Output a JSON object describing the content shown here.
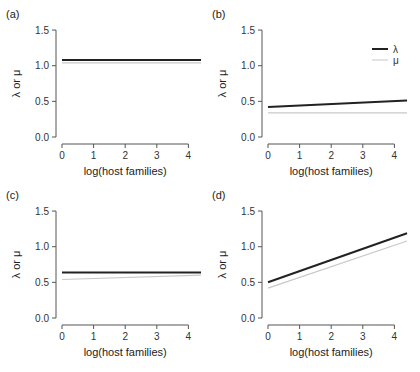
{
  "figure": {
    "width": 420,
    "height": 372,
    "colors": {
      "lambda": "#222222",
      "mu": "#c8c8c8",
      "axis": "#555555"
    }
  },
  "legend": {
    "entries": [
      {
        "label": "λ",
        "color": "#222222",
        "width": 2
      },
      {
        "label": "μ",
        "color": "#c8c8c8",
        "width": 1
      }
    ]
  },
  "chart_data": [
    {
      "type": "line",
      "panel": "(a)",
      "xlabel": "log(host families)",
      "ylabel": "λ or μ",
      "xticks": [
        "0",
        "1",
        "2",
        "3",
        "4"
      ],
      "yticks": [
        "0.0",
        "0.5",
        "1.0",
        "1.5"
      ],
      "xlim": [
        0,
        4.4
      ],
      "ylim": [
        0,
        1.5
      ],
      "series": [
        {
          "name": "λ",
          "x": [
            0,
            4.4
          ],
          "values": [
            1.08,
            1.08
          ]
        },
        {
          "name": "μ",
          "x": [
            0,
            4.4
          ],
          "values": [
            1.04,
            1.04
          ]
        }
      ]
    },
    {
      "type": "line",
      "panel": "(b)",
      "xlabel": "log(host families)",
      "ylabel": "λ or μ",
      "xticks": [
        "0",
        "1",
        "2",
        "3",
        "4"
      ],
      "yticks": [
        "0.0",
        "0.5",
        "1.0",
        "1.5"
      ],
      "xlim": [
        0,
        4.4
      ],
      "ylim": [
        0,
        1.5
      ],
      "legend_position": "upper right",
      "series": [
        {
          "name": "λ",
          "x": [
            0,
            4.4
          ],
          "values": [
            0.42,
            0.51
          ]
        },
        {
          "name": "μ",
          "x": [
            0,
            4.4
          ],
          "values": [
            0.34,
            0.34
          ]
        }
      ]
    },
    {
      "type": "line",
      "panel": "(c)",
      "xlabel": "log(host families)",
      "ylabel": "λ or μ",
      "xticks": [
        "0",
        "1",
        "2",
        "3",
        "4"
      ],
      "yticks": [
        "0.0",
        "0.5",
        "1.0",
        "1.5"
      ],
      "xlim": [
        0,
        4.4
      ],
      "ylim": [
        0,
        1.5
      ],
      "series": [
        {
          "name": "λ",
          "x": [
            0,
            4.4
          ],
          "values": [
            0.64,
            0.64
          ]
        },
        {
          "name": "μ",
          "x": [
            0,
            4.4
          ],
          "values": [
            0.54,
            0.6
          ]
        }
      ]
    },
    {
      "type": "line",
      "panel": "(d)",
      "xlabel": "log(host families)",
      "ylabel": "λ or μ",
      "xticks": [
        "0",
        "1",
        "2",
        "3",
        "4"
      ],
      "yticks": [
        "0.0",
        "0.5",
        "1.0",
        "1.5"
      ],
      "xlim": [
        0,
        4.4
      ],
      "ylim": [
        0,
        1.5
      ],
      "series": [
        {
          "name": "λ",
          "x": [
            0,
            4.4
          ],
          "values": [
            0.5,
            1.19
          ]
        },
        {
          "name": "μ",
          "x": [
            0,
            4.4
          ],
          "values": [
            0.42,
            1.08
          ]
        }
      ]
    }
  ]
}
